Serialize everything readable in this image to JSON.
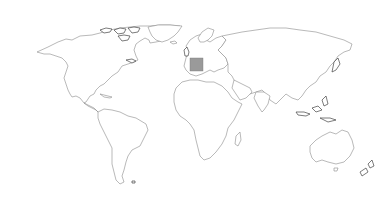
{
  "map": {
    "type": "world-outline",
    "background_color": "#ffffff",
    "outline_color": "#8a8a8a",
    "highlighted_region": {
      "name": "France",
      "color": "#9a9a9a"
    },
    "continents": [
      "North America",
      "South America",
      "Europe",
      "Africa",
      "Asia",
      "Australia"
    ]
  }
}
